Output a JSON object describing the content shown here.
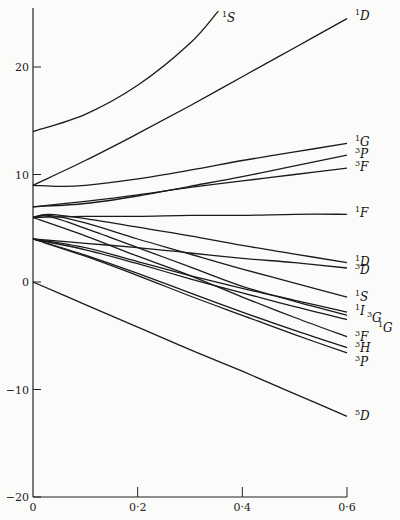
{
  "chart_data": {
    "type": "line",
    "title": "",
    "xlabel": "",
    "ylabel": "",
    "xlim": [
      0,
      0.6
    ],
    "ylim": [
      -20,
      25
    ],
    "grid": false,
    "x_ticks": [
      {
        "v": 0,
        "label": "0"
      },
      {
        "v": 0.2,
        "label": "0·2"
      },
      {
        "v": 0.4,
        "label": "0·4"
      },
      {
        "v": 0.6,
        "label": "0·6"
      }
    ],
    "y_ticks": [
      {
        "v": 20,
        "label": "20"
      },
      {
        "v": 10,
        "label": "10"
      },
      {
        "v": 0,
        "label": "0"
      },
      {
        "v": -10,
        "label": "-10"
      },
      {
        "v": -20,
        "label": "-20"
      }
    ],
    "series": [
      {
        "name": "1S",
        "sup": "1",
        "term": "S",
        "x": [
          0,
          0.1,
          0.2,
          0.3,
          0.354
        ],
        "y": [
          14,
          15.6,
          18.3,
          22.2,
          25.2
        ]
      },
      {
        "name": "1D (upper)",
        "sup": "1",
        "term": "D",
        "x": [
          0,
          0.1,
          0.2,
          0.3,
          0.4,
          0.5,
          0.6
        ],
        "y": [
          9,
          11.3,
          13.8,
          16.4,
          19.1,
          21.8,
          24.5
        ]
      },
      {
        "name": "1G",
        "sup": "1",
        "term": "G",
        "x": [
          0,
          0.05,
          0.1,
          0.2,
          0.3,
          0.4,
          0.5,
          0.6
        ],
        "y": [
          9,
          8.9,
          9.0,
          9.6,
          10.4,
          11.3,
          12.1,
          12.9
        ]
      },
      {
        "name": "3P (upper)",
        "sup": "3",
        "term": "P",
        "x": [
          0,
          0.1,
          0.2,
          0.3,
          0.4,
          0.5,
          0.6
        ],
        "y": [
          7,
          7.3,
          8.0,
          8.9,
          9.8,
          10.8,
          11.8
        ]
      },
      {
        "name": "3F (upper)",
        "sup": "3",
        "term": "F",
        "x": [
          0,
          0.1,
          0.2,
          0.3,
          0.4,
          0.5,
          0.6
        ],
        "y": [
          7,
          7.5,
          8.1,
          8.8,
          9.4,
          10.0,
          10.6
        ]
      },
      {
        "name": "1F",
        "sup": "1",
        "term": "F",
        "x": [
          0,
          0.1,
          0.2,
          0.3,
          0.4,
          0.5,
          0.6
        ],
        "y": [
          6,
          6.1,
          6.1,
          6.2,
          6.2,
          6.3,
          6.3
        ]
      },
      {
        "name": "1D (lower)",
        "sup": "1",
        "term": "D",
        "x": [
          0,
          0.03,
          0.1,
          0.2,
          0.3,
          0.4,
          0.5,
          0.6
        ],
        "y": [
          6,
          6.3,
          5.9,
          5.1,
          4.3,
          3.4,
          2.6,
          1.8
        ]
      },
      {
        "name": "3D",
        "sup": "3",
        "term": "D",
        "x": [
          0,
          0.1,
          0.2,
          0.3,
          0.4,
          0.5,
          0.6
        ],
        "y": [
          4,
          3.6,
          3.2,
          2.7,
          2.2,
          1.8,
          1.3
        ]
      },
      {
        "name": "1S (lower)",
        "sup": "1",
        "term": "S",
        "x": [
          0,
          0.03,
          0.1,
          0.2,
          0.3,
          0.4,
          0.5,
          0.6
        ],
        "y": [
          6,
          6.2,
          5.5,
          4.0,
          2.6,
          1.2,
          -0.1,
          -1.4
        ]
      },
      {
        "name": "1I",
        "sup": "1",
        "term": "I",
        "x": [
          0,
          0.1,
          0.2,
          0.3,
          0.4,
          0.5,
          0.6
        ],
        "y": [
          4,
          3.2,
          1.9,
          0.6,
          -0.6,
          -1.7,
          -2.8
        ]
      },
      {
        "name": "3G",
        "sup": "3",
        "term": "G",
        "x": [
          0,
          0.03,
          0.1,
          0.2,
          0.3,
          0.4,
          0.5,
          0.6
        ],
        "y": [
          6,
          6.1,
          5.0,
          3.2,
          1.4,
          -0.4,
          -1.8,
          -3.1
        ]
      },
      {
        "name": "1G (lower)",
        "sup": "1",
        "term": "G",
        "x": [
          0,
          0.1,
          0.2,
          0.3,
          0.4,
          0.5,
          0.6
        ],
        "y": [
          4,
          3.0,
          1.7,
          0.3,
          -1.0,
          -2.3,
          -3.5
        ]
      },
      {
        "name": "3F (lower)",
        "sup": "3",
        "term": "F",
        "x": [
          0,
          0.1,
          0.2,
          0.3,
          0.4,
          0.5,
          0.6
        ],
        "y": [
          6,
          4.3,
          2.4,
          0.6,
          -1.4,
          -3.3,
          -5.1
        ]
      },
      {
        "name": "3H",
        "sup": "3",
        "term": "H",
        "x": [
          0,
          0.1,
          0.2,
          0.3,
          0.4,
          0.5,
          0.6
        ],
        "y": [
          4,
          2.5,
          0.8,
          -1.0,
          -2.8,
          -4.5,
          -6.1
        ]
      },
      {
        "name": "3P (lower)",
        "sup": "3",
        "term": "P",
        "x": [
          0,
          0.1,
          0.2,
          0.3,
          0.4,
          0.5,
          0.6
        ],
        "y": [
          4,
          2.4,
          0.6,
          -1.3,
          -3.1,
          -4.9,
          -6.6
        ]
      },
      {
        "name": "5D",
        "sup": "5",
        "term": "D",
        "x": [
          0,
          0.1,
          0.2,
          0.3,
          0.4,
          0.5,
          0.6
        ],
        "y": [
          0,
          -2.1,
          -4.2,
          -6.3,
          -8.3,
          -10.4,
          -12.5
        ]
      }
    ],
    "annotations": [
      {
        "text": "1S",
        "sup": "1",
        "term": "S",
        "px": [
          222,
          22
        ]
      },
      {
        "text": "1D",
        "sup": "1",
        "term": "D",
        "px": [
          355,
          20
        ]
      },
      {
        "text": "1G",
        "sup": "1",
        "term": "G",
        "px": [
          355,
          146
        ]
      },
      {
        "text": "3P",
        "sup": "3",
        "term": "P",
        "px": [
          355,
          158
        ]
      },
      {
        "text": "3F",
        "sup": "3",
        "term": "F",
        "px": [
          355,
          171
        ]
      },
      {
        "text": "1F",
        "sup": "1",
        "term": "F",
        "px": [
          355,
          217
        ]
      },
      {
        "text": "1D",
        "sup": "1",
        "term": "D",
        "px": [
          355,
          266
        ]
      },
      {
        "text": "3D",
        "sup": "3",
        "term": "D",
        "px": [
          355,
          274
        ]
      },
      {
        "text": "1S",
        "sup": "1",
        "term": "S",
        "px": [
          355,
          301
        ]
      },
      {
        "text": "1I",
        "sup": "1",
        "term": "I",
        "px": [
          355,
          315
        ]
      },
      {
        "text": "3G",
        "sup": "3",
        "term": "G",
        "px": [
          367,
          322
        ]
      },
      {
        "text": "1G",
        "sup": "1",
        "term": "G",
        "px": [
          378,
          332
        ]
      },
      {
        "text": "3F",
        "sup": "3",
        "term": "F",
        "px": [
          355,
          341
        ]
      },
      {
        "text": "3H",
        "sup": "3",
        "term": "H",
        "px": [
          355,
          352
        ]
      },
      {
        "text": "3P",
        "sup": "3",
        "term": "P",
        "px": [
          355,
          366
        ]
      },
      {
        "text": "5D",
        "sup": "5",
        "term": "D",
        "px": [
          355,
          420
        ]
      }
    ]
  }
}
